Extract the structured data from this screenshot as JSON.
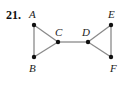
{
  "problem_number": "21.",
  "graph": {
    "vertices": [
      {
        "id": "A",
        "x": 34,
        "y": 25,
        "label_x": 29,
        "label_y": 18
      },
      {
        "id": "B",
        "x": 34,
        "y": 57,
        "label_x": 29,
        "label_y": 72
      },
      {
        "id": "C",
        "x": 58,
        "y": 42,
        "label_x": 55,
        "label_y": 36
      },
      {
        "id": "D",
        "x": 88,
        "y": 42,
        "label_x": 82,
        "label_y": 36
      },
      {
        "id": "E",
        "x": 111,
        "y": 25,
        "label_x": 108,
        "label_y": 18
      },
      {
        "id": "F",
        "x": 111,
        "y": 57,
        "label_x": 110,
        "label_y": 72
      }
    ],
    "edges": [
      [
        "A",
        "B"
      ],
      [
        "A",
        "C"
      ],
      [
        "B",
        "C"
      ],
      [
        "C",
        "D"
      ],
      [
        "D",
        "E"
      ],
      [
        "D",
        "F"
      ],
      [
        "E",
        "F"
      ]
    ]
  },
  "labels": {
    "A": "A",
    "B": "B",
    "C": "C",
    "D": "D",
    "E": "E",
    "F": "F"
  }
}
